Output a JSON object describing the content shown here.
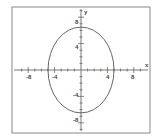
{
  "chart_data": {
    "type": "line",
    "title": "",
    "xlabel": "x",
    "ylabel": "y",
    "xlim": [
      -10,
      10
    ],
    "ylim": [
      -10,
      10
    ],
    "x_ticks": [
      -8,
      -4,
      4,
      8
    ],
    "y_ticks": [
      8,
      4,
      -4,
      -8
    ],
    "grid": false,
    "series": [
      {
        "name": "ellipse",
        "shape": "ellipse",
        "center": [
          0,
          0
        ],
        "semi_axis_x": 5,
        "semi_axis_y": 6.5,
        "x_intercepts": [
          -5,
          5
        ],
        "y_intercepts": [
          6.5,
          -6.5
        ]
      }
    ]
  },
  "axes": {
    "x_label": "x",
    "y_label": "y",
    "x_tick_labels": [
      "-8",
      "-4",
      "4",
      "8"
    ],
    "y_tick_labels": [
      "8",
      "4",
      "-4",
      "-8"
    ]
  }
}
